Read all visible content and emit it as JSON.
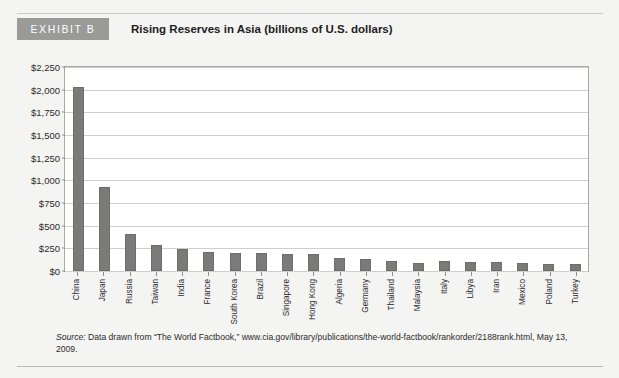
{
  "exhibit": {
    "tag": "EXHIBIT B",
    "title": "Rising Reserves in Asia (billions of U.S. dollars)"
  },
  "source": {
    "lead": "Source:",
    "text": " Data drawn from “The World Factbook,” www.cia.gov/library/publications/the-world-factbook/rankorder/2188rank.html, May 13, 2009."
  },
  "colors": {
    "bar": "#7a7a79",
    "tag_background": "#9a9a99",
    "page_background": "#f4f4f2",
    "plot_background": "#ffffff",
    "gridline": "#cfcfcd"
  },
  "chart_data": {
    "type": "bar",
    "title": "Rising Reserves in Asia (billions of U.S. dollars)",
    "xlabel": "",
    "ylabel": "",
    "ylim": [
      0,
      2250
    ],
    "ytick_step": 250,
    "ytick_labels": [
      "$0",
      "$250",
      "$500",
      "$750",
      "$1,000",
      "$1,250",
      "$1,500",
      "$1,750",
      "$2,000",
      "$2,250"
    ],
    "ytick_values": [
      0,
      250,
      500,
      750,
      1000,
      1250,
      1500,
      1750,
      2000,
      2250
    ],
    "grid": true,
    "legend": "none",
    "categories": [
      "China",
      "Japan",
      "Russia",
      "Taiwan",
      "India",
      "France",
      "South Korea",
      "Brazil",
      "Singapore",
      "Hong Kong",
      "Algeria",
      "Germany",
      "Thailand",
      "Malaysia",
      "Italy",
      "Libya",
      "Iran",
      "Mexico",
      "Poland",
      "Turkey"
    ],
    "values": [
      2033,
      925,
      411,
      291,
      248,
      211,
      201,
      200,
      192,
      183,
      143,
      136,
      111,
      92,
      106,
      98,
      97,
      86,
      79,
      74
    ]
  }
}
